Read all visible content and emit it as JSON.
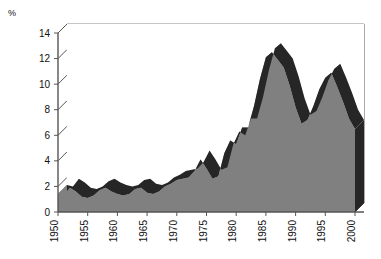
{
  "chart_data": {
    "type": "area",
    "title": "",
    "subtitle": "",
    "xlabel": "",
    "ylabel": "%",
    "axis_unit_label": "%",
    "style": "3d-area",
    "grid": true,
    "legend": "none",
    "xlim": [
      1950,
      2000
    ],
    "ylim": [
      0,
      14
    ],
    "ytick_labels": [
      "0",
      "2",
      "4",
      "6",
      "8",
      "10",
      "12",
      "14"
    ],
    "yticks": [
      0,
      2,
      4,
      6,
      8,
      10,
      12,
      14
    ],
    "xtick_labels": [
      "1950",
      "1955",
      "1960",
      "1965",
      "1970",
      "1975",
      "1980",
      "1985",
      "1990",
      "1995",
      "2000"
    ],
    "xticks": [
      1950,
      1955,
      1960,
      1965,
      1970,
      1975,
      1980,
      1985,
      1990,
      1995,
      2000
    ],
    "xtick_rotation": 90,
    "colors": {
      "area_fill": "#808080",
      "ribbon_top": "#262626",
      "axis": "#555555",
      "grid": "#8a8a8a",
      "text": "#111111",
      "background": "#ffffff"
    },
    "x": [
      1950,
      1951,
      1952,
      1953,
      1954,
      1955,
      1956,
      1957,
      1958,
      1959,
      1960,
      1961,
      1962,
      1963,
      1964,
      1965,
      1966,
      1967,
      1968,
      1969,
      1970,
      1971,
      1972,
      1973,
      1974,
      1975,
      1976,
      1977,
      1978,
      1979,
      1980,
      1981,
      1982,
      1983,
      1984,
      1985,
      1986,
      1987,
      1988,
      1989,
      1990,
      1991,
      1992,
      1993,
      1994,
      1995,
      1996,
      1997,
      1998,
      1999,
      2000
    ],
    "values": [
      1.4,
      1.3,
      1.9,
      1.6,
      1.2,
      1.1,
      1.3,
      1.7,
      1.9,
      1.6,
      1.4,
      1.3,
      1.4,
      1.8,
      1.9,
      1.5,
      1.4,
      1.6,
      2.0,
      2.2,
      2.5,
      2.6,
      2.7,
      3.2,
      4.1,
      3.4,
      2.6,
      2.8,
      4.6,
      5.6,
      5.3,
      6.6,
      6.6,
      8.3,
      10.4,
      12.1,
      12.5,
      11.9,
      11.3,
      9.9,
      8.2,
      6.9,
      7.2,
      8.3,
      9.6,
      10.5,
      10.9,
      9.8,
      8.6,
      7.3,
      6.5
    ],
    "series": [
      {
        "name": "rate",
        "values": [
          1.4,
          1.3,
          1.9,
          1.6,
          1.2,
          1.1,
          1.3,
          1.7,
          1.9,
          1.6,
          1.4,
          1.3,
          1.4,
          1.8,
          1.9,
          1.5,
          1.4,
          1.6,
          2.0,
          2.2,
          2.5,
          2.6,
          2.7,
          3.2,
          4.1,
          3.4,
          2.6,
          2.8,
          4.6,
          5.6,
          5.3,
          6.6,
          6.6,
          8.3,
          10.4,
          12.1,
          12.5,
          11.9,
          11.3,
          9.9,
          8.2,
          6.9,
          7.2,
          8.3,
          9.6,
          10.5,
          10.9,
          9.8,
          8.6,
          7.3,
          6.5
        ]
      }
    ]
  }
}
